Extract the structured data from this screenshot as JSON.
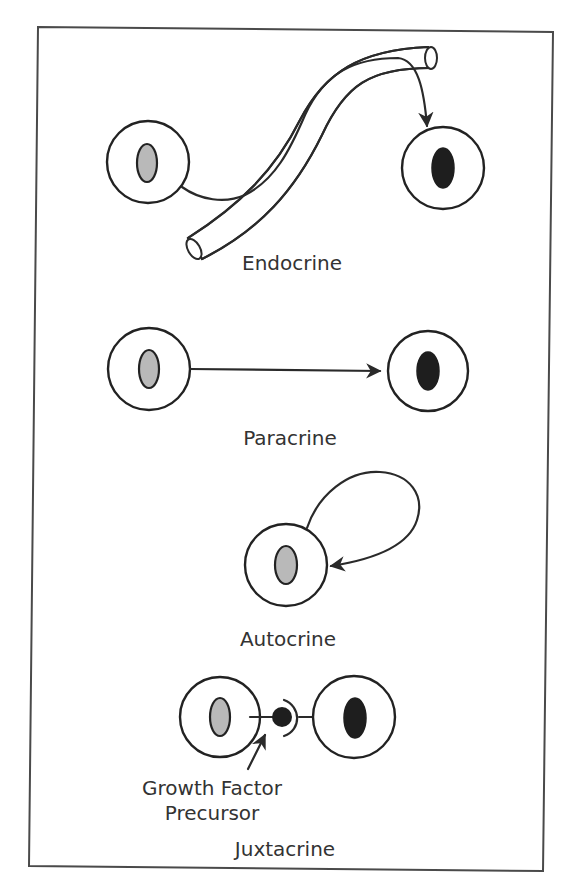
{
  "figure": {
    "panels": [
      {
        "id": "endocrine",
        "label": "Endocrine"
      },
      {
        "id": "paracrine",
        "label": "Paracrine"
      },
      {
        "id": "autocrine",
        "label": "Autocrine"
      },
      {
        "id": "juxtacrine",
        "label": "Juxtacrine",
        "annotation_line1": "Growth Factor",
        "annotation_line2": "Precursor"
      }
    ],
    "colors": {
      "line": "#2a2a2a",
      "secreting_nucleus": "#b9b9b9",
      "target_nucleus": "#1e1e1e",
      "background": "#ffffff"
    }
  }
}
